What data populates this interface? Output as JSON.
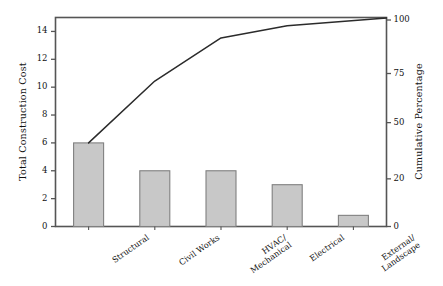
{
  "chart_data": {
    "type": "bar",
    "title": "",
    "subtitle": "",
    "xlabel": "",
    "ylabel": "Total Construction Cost",
    "y2label": "Cumulative Percentage",
    "grid": false,
    "legend": "none",
    "categories": [
      "Structural",
      "Civil Works",
      "HVAC/\nMechanical",
      "Electrical",
      "External/\nLandscape"
    ],
    "ylim": [
      0,
      15
    ],
    "y2lim": [
      0,
      102
    ],
    "yticks": [
      0,
      2,
      4,
      6,
      8,
      10,
      12,
      14
    ],
    "yticklabels": [
      "0",
      "2",
      "4",
      "6",
      "8",
      "10",
      "12",
      "14"
    ],
    "y2ticks": [
      0,
      20,
      50,
      75,
      100
    ],
    "y2ticklabels": [
      "0",
      "20",
      "50",
      "75",
      "100"
    ],
    "series": [
      {
        "name": "Total Construction Cost",
        "kind": "bar",
        "axis": "left",
        "values": [
          6,
          4,
          4,
          3,
          0.8
        ]
      },
      {
        "name": "Cumulative Percentage",
        "kind": "line",
        "axis": "right",
        "values": [
          40,
          71,
          92,
          98,
          100
        ]
      }
    ],
    "colors": {
      "bar_fill": "#c8c8c8",
      "bar_edge": "#808080",
      "line": "#2b2b2b",
      "axis": "#555555",
      "text": "#111111",
      "background": "#ffffff"
    }
  }
}
